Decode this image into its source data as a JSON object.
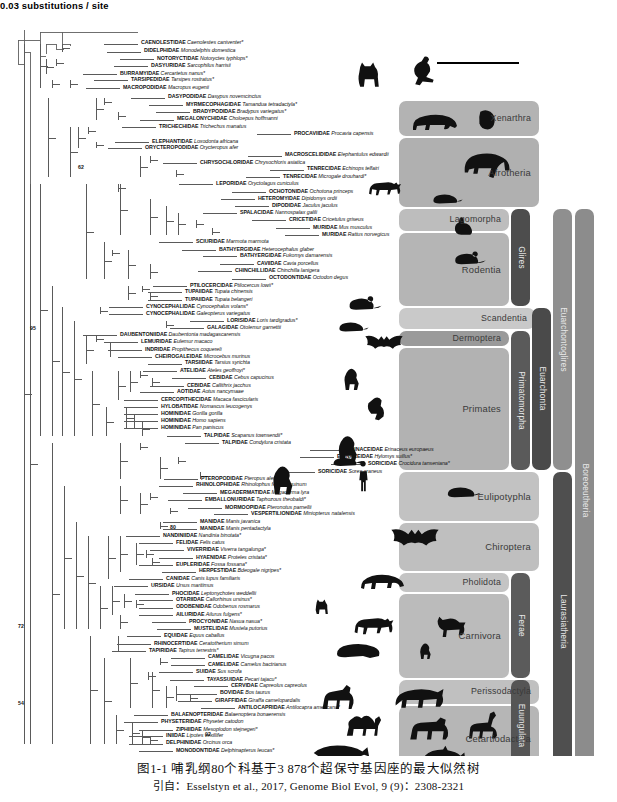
{
  "figure": {
    "scale_bar": {
      "value": "0.03",
      "unit": "substitutions / site",
      "label": "0.03 substitutions / site"
    },
    "caption_line1": "图1-1   哺乳纲80个科基于3 878个超保守基因座的最大似然树",
    "caption_line2": "引自：Esselstyn et al., 2017, Genome Biol Evol, 9 (9)：2308-2321"
  },
  "bootstrap_labels": [
    {
      "value": "62",
      "x": 78,
      "y": 164
    },
    {
      "value": "95",
      "x": 30,
      "y": 325
    },
    {
      "value": "80",
      "x": 170,
      "y": 524
    },
    {
      "value": "72",
      "x": 18,
      "y": 623
    },
    {
      "value": "54",
      "x": 18,
      "y": 700
    },
    {
      "value": "92",
      "x": 205,
      "y": 731
    }
  ],
  "clades": [
    {
      "name": "Xenarthra",
      "orientation": "horizontal",
      "shade": "#b3b3b3"
    },
    {
      "name": "Afrotheria",
      "orientation": "horizontal",
      "shade": "#b0b0b0"
    },
    {
      "name": "Lagomorpha",
      "orientation": "horizontal",
      "shade": "#bdbdbd"
    },
    {
      "name": "Rodentia",
      "orientation": "horizontal",
      "shade": "#b5b5b5"
    },
    {
      "name": "Glires",
      "orientation": "vertical",
      "shade": "#4d4d4d"
    },
    {
      "name": "Scandentia",
      "orientation": "horizontal",
      "shade": "#c9c9c9"
    },
    {
      "name": "Dermoptera",
      "orientation": "horizontal",
      "shade": "#9a9a9a"
    },
    {
      "name": "Primates",
      "orientation": "horizontal",
      "shade": "#b2b2b2"
    },
    {
      "name": "Primatomorpha",
      "orientation": "vertical",
      "shade": "#5a5a5a"
    },
    {
      "name": "Euarchonta",
      "orientation": "vertical",
      "shade": "#4a4a4a"
    },
    {
      "name": "Euarchontoglires",
      "orientation": "vertical",
      "shade": "#8f8f8f"
    },
    {
      "name": "Eulipotyphla",
      "orientation": "horizontal",
      "shade": "#c2c2c2"
    },
    {
      "name": "Chiroptera",
      "orientation": "horizontal",
      "shade": "#bfbfbf"
    },
    {
      "name": "Pholidota",
      "orientation": "horizontal",
      "shade": "#c4c4c4"
    },
    {
      "name": "Carnivora",
      "orientation": "horizontal",
      "shade": "#bbbbbb"
    },
    {
      "name": "Ferae",
      "orientation": "vertical",
      "shade": "#5b5b5b"
    },
    {
      "name": "Perissodactyla",
      "orientation": "horizontal",
      "shade": "#c0c0c0"
    },
    {
      "name": "Cetartiodactyla",
      "orientation": "horizontal",
      "shade": "#b6b6b6"
    },
    {
      "name": "Euungulata",
      "orientation": "vertical",
      "shade": "#555555"
    },
    {
      "name": "Laurasiatheria",
      "orientation": "vertical",
      "shade": "#4f4f4f"
    },
    {
      "name": "Boreoeutheria",
      "orientation": "vertical",
      "shade": "#8c8c8c"
    }
  ],
  "taxa": [
    {
      "family": "CAENOLESTIDAE",
      "species": "Caenolestes caniventer*",
      "x": 141,
      "y": 44,
      "tip": 138
    },
    {
      "family": "DIDELPHIDAE",
      "species": "Monodelphis domestica",
      "x": 144,
      "y": 54,
      "tip": 141
    },
    {
      "family": "NOTORYCTIDAE",
      "species": "Notoryctes typhlops*",
      "x": 157,
      "y": 63,
      "tip": 154
    },
    {
      "family": "DASYURIDAE",
      "species": "Sarcophilus harrisii",
      "x": 151,
      "y": 72,
      "tip": 148
    },
    {
      "family": "BURRAMYIDAE",
      "species": "Cercartetus nanus*",
      "x": 120,
      "y": 81,
      "tip": 117
    },
    {
      "family": "TARSIPEDIDAE",
      "species": "Tarsipes rostratus*",
      "x": 131,
      "y": 89,
      "tip": 128
    },
    {
      "family": "MACROPODIDAE",
      "species": "Macropus eugenii",
      "x": 123,
      "y": 98,
      "tip": 120
    },
    {
      "family": "DASYPODIDAE",
      "species": "Dasypus novemcinctus",
      "x": 168,
      "y": 110,
      "tip": 165
    },
    {
      "family": "MYRMECOPHAGIDAE",
      "species": "Tamandua tetradactyla*",
      "x": 186,
      "y": 119,
      "tip": 183
    },
    {
      "family": "BRADYPODIDAE",
      "species": "Bradypus variegatus*",
      "x": 193,
      "y": 128,
      "tip": 190
    },
    {
      "family": "MEGALONYCHIDAE",
      "species": "Choloepus hoffmanni",
      "x": 177,
      "y": 137,
      "tip": 174
    },
    {
      "family": "TRICHECHIDAE",
      "species": "Trichechus manatus",
      "x": 159,
      "y": 146,
      "tip": 156
    },
    {
      "family": "PROCAVIIDAE",
      "species": "Procavia capensis",
      "x": 294,
      "y": 155,
      "tip": 291
    },
    {
      "family": "ELEPHANTIDAE",
      "species": "Loxodonta africana",
      "x": 152,
      "y": 164,
      "tip": 149
    },
    {
      "family": "ORYCTEROPODIDAE",
      "species": "Orycteropus afer",
      "x": 145,
      "y": 172,
      "tip": 142
    },
    {
      "family": "MACROSCELIDIDAE",
      "species": "Elephantulus edwardii",
      "x": 285,
      "y": 181,
      "tip": 282
    },
    {
      "family": "CHRYSOCHLORIDAE",
      "species": "Chrysochloris asiatica",
      "x": 200,
      "y": 190,
      "tip": 197
    },
    {
      "family": "TENRECIDAE",
      "species": "Echinops telfairi",
      "x": 307,
      "y": 198,
      "tip": 304
    },
    {
      "family": "TENRECIDAE",
      "species": "Microgale drouhardi*",
      "x": 283,
      "y": 207,
      "tip": 280
    },
    {
      "family": "LEPORIDAE",
      "species": "Oryctolagus cuniculus",
      "x": 216,
      "y": 216,
      "tip": 213
    },
    {
      "family": "OCHOTONIDAE",
      "species": "Ochotona princeps",
      "x": 269,
      "y": 225,
      "tip": 266
    },
    {
      "family": "HETEROMYIDAE",
      "species": "Dipidomys ordii",
      "x": 258,
      "y": 234,
      "tip": 255
    },
    {
      "family": "DIPODIDAE",
      "species": "Jaculus jaculus",
      "x": 272,
      "y": 243,
      "tip": 269
    },
    {
      "family": "SPALACIDAE",
      "species": "Nannospalax galili",
      "x": 240,
      "y": 251,
      "tip": 237
    },
    {
      "family": "CRICETIDAE",
      "species": "Cricetulus griseus",
      "x": 289,
      "y": 260,
      "tip": 286
    },
    {
      "family": "MURIDAE",
      "species": "Mus musculus",
      "x": 313,
      "y": 269,
      "tip": 310
    },
    {
      "family": "MURIDAE",
      "species": "Rattus norvegicus",
      "x": 322,
      "y": 278,
      "tip": 319
    },
    {
      "family": "SCIURIDAE",
      "species": "Marmota marmota",
      "x": 196,
      "y": 287,
      "tip": 193
    },
    {
      "family": "BATHYERGIDAE",
      "species": "Heterocephalus glaber",
      "x": 219,
      "y": 296,
      "tip": 216
    },
    {
      "family": "BATHYERGIDAE",
      "species": "Fukomys damarensis",
      "x": 240,
      "y": 304,
      "tip": 237
    },
    {
      "family": "CAVIIDAE",
      "species": "Cavia porcellus",
      "x": 257,
      "y": 313,
      "tip": 254
    },
    {
      "family": "CHINCHILLIDAE",
      "species": "Chinchilla lanigera",
      "x": 235,
      "y": 322,
      "tip": 232
    },
    {
      "family": "OCTODONTIDAE",
      "species": "Octodon degus",
      "x": 269,
      "y": 331,
      "tip": 266
    },
    {
      "family": "PTILOCERCIDAE",
      "species": "Ptilocercus lowii*",
      "x": 190,
      "y": 340,
      "tip": 187
    },
    {
      "family": "TUPAIIDAE",
      "species": "Tupaia chinensis",
      "x": 185,
      "y": 348,
      "tip": 182
    },
    {
      "family": "TUPAIIDAE",
      "species": "Tupaia belangeri",
      "x": 185,
      "y": 357,
      "tip": 182
    },
    {
      "family": "CYNOCEPHALIDAE",
      "species": "Cynocephalus volans*",
      "x": 146,
      "y": 366,
      "tip": 143
    },
    {
      "family": "CYNOCEPHALIDAE",
      "species": "Galeopterus variegatus",
      "x": 146,
      "y": 374,
      "tip": 143
    },
    {
      "family": "LORISIDAE",
      "species": "Loris tardigradus*",
      "x": 227,
      "y": 383,
      "tip": 224
    },
    {
      "family": "GALAGIDAE",
      "species": "Otolemur garnettii",
      "x": 207,
      "y": 392,
      "tip": 204
    },
    {
      "family": "DAUBENTONIIDAE",
      "species": "Daubentonia madagascarensis",
      "x": 120,
      "y": 400,
      "tip": 117
    },
    {
      "family": "LEMURIDAE",
      "species": "Eulemur macaco",
      "x": 141,
      "y": 409,
      "tip": 138
    },
    {
      "family": "INDRIDAE",
      "species": "Propithecus coquereli",
      "x": 145,
      "y": 418,
      "tip": 142
    },
    {
      "family": "CHEIROGALEIDAE",
      "species": "Microcebus murinus",
      "x": 155,
      "y": 427,
      "tip": 152
    },
    {
      "family": "TARSIIDAE",
      "species": "Tarsius syrichta",
      "x": 185,
      "y": 435,
      "tip": 182
    },
    {
      "family": "ATELIDAE",
      "species": "Ateles geoffroyi*",
      "x": 180,
      "y": 444,
      "tip": 177
    },
    {
      "family": "CEBIDAE",
      "species": "Cebus capucinus",
      "x": 209,
      "y": 453,
      "tip": 206
    },
    {
      "family": "CEBIDAE",
      "species": "Callithrix jacchus",
      "x": 187,
      "y": 462,
      "tip": 184
    },
    {
      "family": "AOTIDAE",
      "species": "Aotus nancymaae",
      "x": 177,
      "y": 470,
      "tip": 174
    },
    {
      "family": "CERCOPITHECIDAE",
      "species": "Macaca fascicularis",
      "x": 161,
      "y": 479,
      "tip": 158
    },
    {
      "family": "HYLOBATIDAE",
      "species": "Nomascus leucogenys",
      "x": 161,
      "y": 488,
      "tip": 158
    },
    {
      "family": "HOMINIDAE",
      "species": "Gorilla gorilla",
      "x": 161,
      "y": 497,
      "tip": 158
    },
    {
      "family": "HOMINIDAE",
      "species": "Homo sapiens",
      "x": 161,
      "y": 505,
      "tip": 158
    },
    {
      "family": "HOMINIDAE",
      "species": "Pan paniscus",
      "x": 161,
      "y": 514,
      "tip": 158
    },
    {
      "family": "TALPIDAE",
      "species": "Scapanus townsendii*",
      "x": 204,
      "y": 523,
      "tip": 201
    },
    {
      "family": "TALPIDAE",
      "species": "Condylura cristata",
      "x": 222,
      "y": 532,
      "tip": 219
    },
    {
      "family": "ERINACEIDAE",
      "species": "Erinaceus europaeus",
      "x": 347,
      "y": 541,
      "tip": 344
    },
    {
      "family": "ERINACEIDAE",
      "species": "Hylomys suillus*",
      "x": 337,
      "y": 549,
      "tip": 334
    },
    {
      "family": "SORICIDAE",
      "species": "Crocidura tanseniana*",
      "x": 368,
      "y": 558,
      "tip": 365
    },
    {
      "family": "SORICIDAE",
      "species": "Sorex araneus",
      "x": 318,
      "y": 567,
      "tip": 315
    },
    {
      "family": "PTEROPODIDAE",
      "species": "Pteropus alecto",
      "x": 201,
      "y": 576,
      "tip": 198
    },
    {
      "family": "RHINOLOPHIDAE",
      "species": "Rhinolophus ferrumequinum",
      "x": 196,
      "y": 584,
      "tip": 193
    },
    {
      "family": "MEGADERMATIDAE",
      "species": "Megaderma lyra",
      "x": 220,
      "y": 593,
      "tip": 217
    },
    {
      "family": "EMBALLONURIDAE",
      "species": "Taphozous theobaldi*",
      "x": 205,
      "y": 602,
      "tip": 202
    },
    {
      "family": "MORMOOPIDAE",
      "species": "Pteronotus parnellii",
      "x": 225,
      "y": 611,
      "tip": 222
    },
    {
      "family": "VESPERTILIONIDAE",
      "species": "Miniopterus natalensis",
      "x": 251,
      "y": 619,
      "tip": 248
    },
    {
      "family": "MANIDAE",
      "species": "Manis javanica",
      "x": 200,
      "y": 628,
      "tip": 197
    },
    {
      "family": "MANIDAE",
      "species": "Manis pentadactyla",
      "x": 200,
      "y": 637,
      "tip": 197
    },
    {
      "family": "NANDINIIDAE",
      "species": "Nandinia binotata*",
      "x": 163,
      "y": 646,
      "tip": 160
    },
    {
      "family": "FELIDAE",
      "species": "Felis catus",
      "x": 176,
      "y": 654,
      "tip": 173
    },
    {
      "family": "VIVERRIDAE",
      "species": "Viverra tangalunga*",
      "x": 187,
      "y": 663,
      "tip": 184
    },
    {
      "family": "HYAENIDAE",
      "species": "Proteles cristata*",
      "x": 196,
      "y": 672,
      "tip": 193
    },
    {
      "family": "EUPLERIDAE",
      "species": "Fossa fossana*",
      "x": 176,
      "y": 681,
      "tip": 173
    },
    {
      "family": "HERPESTIDAE",
      "species": "Bdeogale nigripes*",
      "x": 199,
      "y": 689,
      "tip": 196
    },
    {
      "family": "CANIDAE",
      "species": "Canis lupus familiaris",
      "x": 166,
      "y": 698,
      "tip": 163
    },
    {
      "family": "URSIDAE",
      "species": "Ursus maritimus",
      "x": 151,
      "y": 707,
      "tip": 148
    },
    {
      "family": "PHOCIDAE",
      "species": "Leptonychotes weddellii",
      "x": 172,
      "y": 716,
      "tip": 169
    },
    {
      "family": "OTARIIDAE",
      "species": "Callorhinus ursinus*",
      "x": 176,
      "y": 724,
      "tip": 173
    },
    {
      "family": "ODOBENIDAE",
      "species": "Odobenus rosmarus",
      "x": 176,
      "y": 733,
      "tip": 173
    },
    {
      "family": "AILURIDAE",
      "species": "Ailurus fulgens*",
      "x": 176,
      "y": 742,
      "tip": 173
    },
    {
      "family": "PROCYONIDAE",
      "species": "Nasua nasua*",
      "x": 189,
      "y": 751,
      "tip": 186
    },
    {
      "family": "MUSTELIDAE",
      "species": "Mustela putorius",
      "x": 194,
      "y": 759,
      "tip": 191
    },
    {
      "family": "EQUIDAE",
      "species": "Equus caballus",
      "x": 164,
      "y": 768,
      "tip": 161
    },
    {
      "family": "RHINOCERTIDAE",
      "species": "Ceratotherium simum",
      "x": 154,
      "y": 777,
      "tip": 151
    },
    {
      "family": "TAPIRIDAE",
      "species": "Tapirus terrestris*",
      "x": 149,
      "y": 786,
      "tip": 146
    },
    {
      "family": "CAMELIDAE",
      "species": "Vicugna pacos",
      "x": 208,
      "y": 794,
      "tip": 205
    },
    {
      "family": "CAMELIDAE",
      "species": "Camelus bactrianus",
      "x": 208,
      "y": 803,
      "tip": 205
    },
    {
      "family": "SUIDAE",
      "species": "Sus scrofa",
      "x": 196,
      "y": 812,
      "tip": 193
    },
    {
      "family": "TAYASSUIDAE",
      "species": "Pecari tajacu*",
      "x": 207,
      "y": 821,
      "tip": 204
    },
    {
      "family": "CERVIDAE",
      "species": "Capreolus capreolus",
      "x": 231,
      "y": 829,
      "tip": 228
    },
    {
      "family": "BOVIDAE",
      "species": "Bos taurus",
      "x": 220,
      "y": 838,
      "tip": 217
    },
    {
      "family": "GIRAFFIDAE",
      "species": "Giraffa camelopardalis",
      "x": 215,
      "y": 847,
      "tip": 212
    },
    {
      "family": "ANTILOCAPRIDAE",
      "species": "Antilocapra americana*",
      "x": 238,
      "y": 856,
      "tip": 235
    },
    {
      "family": "BALAENOPTERIDAE",
      "species": "Balaenoptera bonaerensis",
      "x": 171,
      "y": 864,
      "tip": 168
    },
    {
      "family": "PHYSETERIDAE",
      "species": "Physeter catodon",
      "x": 161,
      "y": 873,
      "tip": 158
    },
    {
      "family": "ZIPHIIDAE",
      "species": "Mesoplodon stejnegeri*",
      "x": 176,
      "y": 882,
      "tip": 173
    },
    {
      "family": "INIIDAE",
      "species": "Lipotes vexillifer",
      "x": 166,
      "y": 890,
      "tip": 163
    },
    {
      "family": "DELPHINIDAE",
      "species": "Orcinus orca",
      "x": 166,
      "y": 899,
      "tip": 163
    },
    {
      "family": "MONODONTIDAE",
      "species": "Delphinapterus leucas*",
      "x": 176,
      "y": 908,
      "tip": 173
    }
  ]
}
